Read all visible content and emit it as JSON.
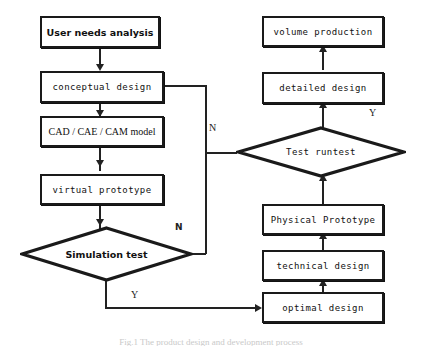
{
  "diagram": {
    "type": "flowchart",
    "caption": "Fig.1  The product design and development process",
    "colors": {
      "stroke": "#1a1a1a",
      "background": "#ffffff",
      "text": "#111111"
    },
    "nodes": [
      {
        "id": "user-needs-analysis",
        "label": "User needs analysis",
        "shape": "rectangle"
      },
      {
        "id": "conceptual-design",
        "label": "conceptual design",
        "shape": "rectangle"
      },
      {
        "id": "cad-cae-cam-model",
        "label": "CAD / CAE / CAM model",
        "shape": "rectangle"
      },
      {
        "id": "virtual-prototype",
        "label": "virtual prototype",
        "shape": "rectangle"
      },
      {
        "id": "simulation-test",
        "label": "Simulation test",
        "shape": "diamond"
      },
      {
        "id": "optimal-design",
        "label": "optimal design",
        "shape": "rectangle"
      },
      {
        "id": "technical-design",
        "label": "technical design",
        "shape": "rectangle"
      },
      {
        "id": "physical-prototype",
        "label": "Physical Prototype",
        "shape": "rectangle"
      },
      {
        "id": "test-runtest",
        "label": "Test runtest",
        "shape": "diamond"
      },
      {
        "id": "detailed-design",
        "label": "detailed design",
        "shape": "rectangle"
      },
      {
        "id": "volume-production",
        "label": "volume production",
        "shape": "rectangle"
      }
    ],
    "edge_labels": {
      "simulation_no": "N",
      "simulation_yes": "Y",
      "runtest_no": "N",
      "runtest_yes": "Y"
    },
    "edges": [
      {
        "from": "user-needs-analysis",
        "to": "conceptual-design",
        "label": ""
      },
      {
        "from": "conceptual-design",
        "to": "cad-cae-cam-model",
        "label": ""
      },
      {
        "from": "cad-cae-cam-model",
        "to": "virtual-prototype",
        "label": ""
      },
      {
        "from": "virtual-prototype",
        "to": "simulation-test",
        "label": ""
      },
      {
        "from": "simulation-test",
        "to": "conceptual-design",
        "label": "N"
      },
      {
        "from": "simulation-test",
        "to": "optimal-design",
        "label": "Y"
      },
      {
        "from": "optimal-design",
        "to": "technical-design",
        "label": ""
      },
      {
        "from": "technical-design",
        "to": "physical-prototype",
        "label": ""
      },
      {
        "from": "physical-prototype",
        "to": "test-runtest",
        "label": ""
      },
      {
        "from": "test-runtest",
        "to": "conceptual-design",
        "label": "N"
      },
      {
        "from": "test-runtest",
        "to": "detailed-design",
        "label": "Y"
      },
      {
        "from": "detailed-design",
        "to": "volume-production",
        "label": ""
      }
    ]
  }
}
